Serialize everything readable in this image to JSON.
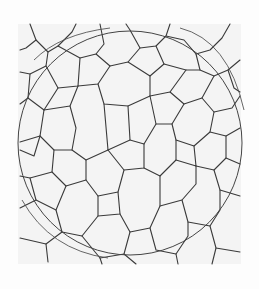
{
  "figure": {
    "type": "grain-boundary micrograph",
    "overlay": "measurement circle",
    "colors": {
      "background": "#ffffff",
      "specimen": "#f4f4f4",
      "boundary": "#3a3a3a",
      "circle": "#444444"
    },
    "circle": {
      "cx": 130,
      "cy": 143,
      "r": 112
    }
  }
}
